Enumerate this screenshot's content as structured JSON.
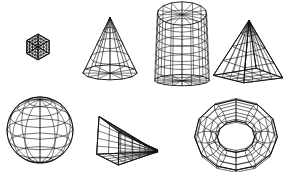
{
  "figure": {
    "background_color": "#ffffff",
    "stroke_color": "#111111",
    "width": 283,
    "height": 172,
    "artifact_note": "faint scanner speckle along top edge"
  },
  "shapes": [
    {
      "id": "cube",
      "label": "Wireframe cube",
      "row": "top",
      "order": 1,
      "kind": "hexahedron",
      "projection": "isometric",
      "subdivisions": 4,
      "bbox": {
        "x": 6,
        "y": 14,
        "width": 64,
        "height": 66
      },
      "center": {
        "x": 38,
        "y": 47
      }
    },
    {
      "id": "cone",
      "label": "Wireframe cone",
      "row": "top",
      "order": 2,
      "kind": "cone",
      "projection": "perspective",
      "radial_segments": 12,
      "rings": 4,
      "bbox": {
        "x": 82,
        "y": 13,
        "width": 56,
        "height": 70
      },
      "center": {
        "x": 110,
        "y": 48
      }
    },
    {
      "id": "cylinder",
      "label": "Wireframe cylinder",
      "row": "top",
      "order": 3,
      "kind": "cylinder",
      "projection": "perspective",
      "radial_segments": 16,
      "rings": 8,
      "bbox": {
        "x": 156,
        "y": 9,
        "width": 53,
        "height": 74
      },
      "center": {
        "x": 182,
        "y": 46
      }
    },
    {
      "id": "pyramid",
      "label": "Wireframe pyramid",
      "row": "top",
      "order": 4,
      "kind": "square-pyramid",
      "projection": "perspective",
      "base_divisions": 4,
      "bbox": {
        "x": 217,
        "y": 11,
        "width": 64,
        "height": 72
      },
      "center": {
        "x": 249,
        "y": 53
      }
    },
    {
      "id": "sphere",
      "label": "Wireframe sphere",
      "row": "bottom",
      "order": 5,
      "kind": "sphere",
      "projection": "perspective",
      "meridians": 12,
      "parallels": 7,
      "bbox": {
        "x": 7,
        "y": 96,
        "width": 66,
        "height": 68
      },
      "center": {
        "x": 40,
        "y": 130
      }
    },
    {
      "id": "wedge",
      "label": "Wireframe wedge",
      "row": "bottom",
      "order": 6,
      "kind": "wedge-prism",
      "projection": "perspective",
      "grid_divisions": 5,
      "bbox": {
        "x": 94,
        "y": 113,
        "width": 64,
        "height": 50
      },
      "center": {
        "x": 126,
        "y": 138
      }
    },
    {
      "id": "torus",
      "label": "Wireframe torus",
      "row": "bottom",
      "order": 7,
      "kind": "torus",
      "projection": "perspective",
      "major_segments": 12,
      "minor_segments": 10,
      "bbox": {
        "x": 188,
        "y": 104,
        "width": 95,
        "height": 66
      },
      "center": {
        "x": 236,
        "y": 137
      }
    }
  ],
  "noise_marks": [
    {
      "x": 30,
      "y": 2,
      "width": 5,
      "height": 2
    },
    {
      "x": 38,
      "y": 2,
      "width": 4,
      "height": 2
    },
    {
      "x": 47,
      "y": 2,
      "width": 3,
      "height": 2
    },
    {
      "x": 54,
      "y": 1,
      "width": 6,
      "height": 3
    },
    {
      "x": 63,
      "y": 2,
      "width": 3,
      "height": 2
    }
  ]
}
